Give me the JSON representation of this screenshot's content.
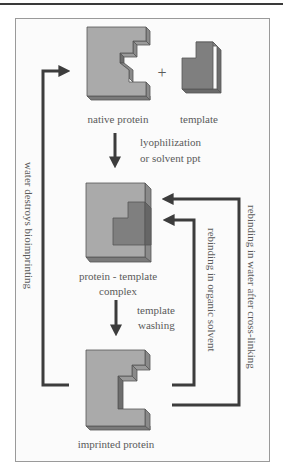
{
  "diagram": {
    "title_rule": true,
    "nodes": {
      "native_protein": {
        "label": "native protein"
      },
      "template": {
        "label": "template"
      },
      "plus": {
        "label": "+"
      },
      "complex": {
        "label_line1": "protein - template",
        "label_line2": "complex"
      },
      "imprinted": {
        "label": "imprinted protein"
      }
    },
    "edges": {
      "step1": {
        "line1": "lyophilization",
        "line2": "or solvent ppt"
      },
      "step2": {
        "line1": "template",
        "line2": "washing"
      },
      "left_loop": {
        "label": "water destroys bioimprinting"
      },
      "inner_right_loop": {
        "label": "rebinding in organic solvent"
      },
      "outer_right_loop": {
        "label": "rebinding in water after cross-linking"
      }
    },
    "colors": {
      "protein_face": "#a9a9a9",
      "protein_side": "#8a8a8a",
      "protein_dark": "#6e6e6e",
      "template_face": "#7c7c7c",
      "arrow": "#3c3c3c",
      "text": "#5a5a5a"
    }
  }
}
